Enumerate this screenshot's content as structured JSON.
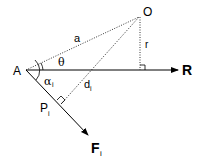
{
  "diagram": {
    "points": {
      "A": {
        "label": "A"
      },
      "O": {
        "label": "O"
      },
      "P": {
        "label": "P",
        "subscript": "i"
      }
    },
    "vectors": {
      "R": {
        "label": "R"
      },
      "F": {
        "label": "F",
        "subscript": "i"
      }
    },
    "segments": {
      "a": {
        "label": "a",
        "style": "dotted"
      },
      "r": {
        "label": "r",
        "style": "dotted"
      },
      "d": {
        "label": "d",
        "subscript": "i",
        "style": "dotted"
      }
    },
    "angles": {
      "theta": {
        "label": "θ"
      },
      "alpha": {
        "label": "α",
        "subscript": "i"
      }
    },
    "colors": {
      "stroke": "#000000",
      "background": "#ffffff"
    }
  }
}
